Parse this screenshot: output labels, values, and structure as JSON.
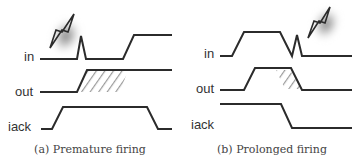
{
  "panels": [
    {
      "id": "a",
      "caption": "(a) Premature firing",
      "signals": [
        {
          "label": "in",
          "waveform": "low, glitch spike, low, rise to high"
        },
        {
          "label": "out",
          "waveform": "low, early rise to high (hatched premature region)"
        },
        {
          "label": "iack",
          "waveform": "low, rise to high, fall to low"
        }
      ],
      "annotation": "lightning-bolt glitch on in"
    },
    {
      "id": "b",
      "caption": "(b) Prolonged firing",
      "signals": [
        {
          "label": "in",
          "waveform": "low, rise to high, fall with glitch spike, low"
        },
        {
          "label": "out",
          "waveform": "low, rise to high, delayed fall (hatched prolonged region)"
        },
        {
          "label": "iack",
          "waveform": "high, fall to low"
        }
      ],
      "annotation": "lightning-bolt glitch on in"
    }
  ],
  "colors": {
    "waveform": "#2b2b2b",
    "hatch": "#9a9a9a",
    "label": "#333333",
    "caption": "#444444",
    "background": "#ffffff"
  }
}
